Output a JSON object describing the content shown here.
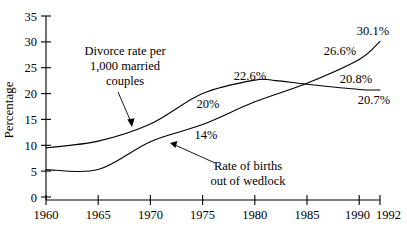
{
  "chart_data": {
    "type": "line",
    "title": "",
    "xlabel": "",
    "ylabel": "Percentage",
    "xlim": [
      1960,
      1992
    ],
    "ylim": [
      0,
      35
    ],
    "grid": false,
    "legend_position": "none (in-plot arrow callouts)",
    "x_ticks": [
      "1960",
      "1965",
      "1970",
      "1975",
      "1980",
      "1985",
      "1990",
      "1992"
    ],
    "y_ticks": [
      "0",
      "5",
      "10",
      "15",
      "20",
      "25",
      "30",
      "35"
    ],
    "series": [
      {
        "name": "Divorce rate per 1,000 married couples",
        "x": [
          1960,
          1965,
          1970,
          1975,
          1980,
          1982,
          1985,
          1990,
          1992
        ],
        "values": [
          9.5,
          10.8,
          14.1,
          20.0,
          22.6,
          22.5,
          21.8,
          20.8,
          20.7
        ]
      },
      {
        "name": "Rate of births out of wedlock",
        "x": [
          1960,
          1965,
          1970,
          1975,
          1980,
          1985,
          1990,
          1992
        ],
        "values": [
          5.3,
          5.3,
          10.7,
          14.0,
          18.4,
          22.0,
          26.6,
          30.1
        ]
      }
    ],
    "point_labels": [
      {
        "text": "20%",
        "series": "Divorce rate per 1,000 married couples",
        "x": 1976,
        "value": 20.0
      },
      {
        "text": "22.6%",
        "series": "Divorce rate per 1,000 married couples",
        "x": 1980,
        "value": 22.6
      },
      {
        "text": "20.8%",
        "series": "Divorce rate per 1,000 married couples",
        "x": 1990,
        "value": 20.8
      },
      {
        "text": "20.7%",
        "series": "Divorce rate per 1,000 married couples",
        "x": 1992,
        "value": 20.7
      },
      {
        "text": "14%",
        "series": "Rate of births out of wedlock",
        "x": 1976,
        "value": 14.0
      },
      {
        "text": "26.6%",
        "series": "Rate of births out of wedlock",
        "x": 1990,
        "value": 26.6
      },
      {
        "text": "30.1%",
        "series": "Rate of births out of wedlock",
        "x": 1992,
        "value": 30.1
      }
    ],
    "annotations": [
      {
        "name": "divorce-callout",
        "lines": [
          "Divorce rate per",
          "1,000 married",
          "couples"
        ]
      },
      {
        "name": "wedlock-callout",
        "lines": [
          "Rate of births",
          "out of wedlock"
        ]
      }
    ],
    "colors": {
      "line": "#000000",
      "axis": "#000000",
      "background": "#ffffff"
    }
  }
}
